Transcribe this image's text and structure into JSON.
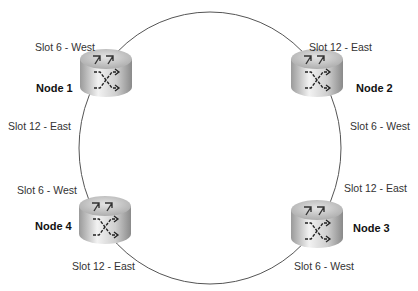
{
  "diagram": {
    "type": "ring-topology",
    "ring": {
      "cx": 210,
      "cy": 148,
      "rx": 131,
      "ry": 136,
      "stroke": "#555555"
    },
    "nodes": [
      {
        "id": "node1",
        "label": "Node 1",
        "icon": "router-icon",
        "ports": [
          {
            "label": "Slot 6 - West"
          },
          {
            "label": "Slot 12 - East"
          }
        ]
      },
      {
        "id": "node2",
        "label": "Node 2",
        "icon": "router-icon",
        "ports": [
          {
            "label": "Slot 12 - East"
          },
          {
            "label": "Slot 6 - West"
          }
        ]
      },
      {
        "id": "node3",
        "label": "Node 3",
        "icon": "router-icon",
        "ports": [
          {
            "label": "Slot 12 - East"
          },
          {
            "label": "Slot 6 - West"
          }
        ]
      },
      {
        "id": "node4",
        "label": "Node 4",
        "icon": "router-icon",
        "ports": [
          {
            "label": "Slot 6 - West"
          },
          {
            "label": "Slot 12 - East"
          }
        ]
      }
    ],
    "edges": [
      {
        "from": "node1",
        "from_port": "Slot 6 - West",
        "to": "node2",
        "to_port": "Slot 12 - East"
      },
      {
        "from": "node2",
        "from_port": "Slot 6 - West",
        "to": "node3",
        "to_port": "Slot 12 - East"
      },
      {
        "from": "node3",
        "from_port": "Slot 6 - West",
        "to": "node4",
        "to_port": "Slot 12 - East"
      },
      {
        "from": "node4",
        "from_port": "Slot 6 - West",
        "to": "node1",
        "to_port": "Slot 12 - East"
      }
    ]
  }
}
